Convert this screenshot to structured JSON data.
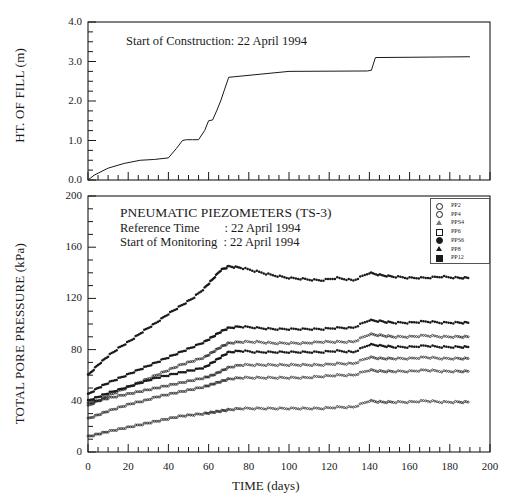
{
  "figure": {
    "width": 518,
    "height": 501,
    "background": "#ffffff",
    "ink": "#1a1a1a"
  },
  "annotations": {
    "construction_note": "Start of Construction: 22 April 1994",
    "pneumatic_title": "PNEUMATIC PIEZOMETERS (TS-3)",
    "reference_time": "Reference Time        : 22 April 1994",
    "start_of_monitoring": "Start of Monitoring  : 22 April 1994"
  },
  "legend": {
    "position": "top-right-inside",
    "entries": [
      {
        "label": "PP2",
        "marker": "open-circle"
      },
      {
        "label": "PP4",
        "marker": "open-circle"
      },
      {
        "label": "PPS4",
        "marker": "open-triangle"
      },
      {
        "label": "PP6",
        "marker": "open-square"
      },
      {
        "label": "PPS6",
        "marker": "filled-circle"
      },
      {
        "label": "PP8",
        "marker": "filled-triangle"
      },
      {
        "label": "PP12",
        "marker": "filled-square"
      }
    ]
  },
  "chart_data": [
    {
      "id": "fill-height",
      "type": "line",
      "title": "",
      "xlabel": "",
      "ylabel": "HT. OF FILL (m)",
      "xlim": [
        0,
        200
      ],
      "ylim": [
        0.0,
        4.0
      ],
      "yticks": [
        0.0,
        1.0,
        2.0,
        3.0,
        4.0
      ],
      "ytick_labels": [
        "0.0",
        "1.0",
        "2.0",
        "3.0",
        "4.0"
      ],
      "yminor_step": 0.25,
      "xticks": [
        0,
        20,
        40,
        60,
        80,
        100,
        120,
        140,
        160,
        180,
        200
      ],
      "grid": false,
      "series": [
        {
          "name": "Height of fill",
          "x": [
            0,
            3,
            10,
            18,
            26,
            33,
            40,
            44,
            47,
            49,
            52,
            55,
            58,
            60,
            62,
            64,
            66,
            68,
            70,
            100,
            139,
            141,
            143,
            190
          ],
          "y": [
            0.0,
            0.12,
            0.3,
            0.42,
            0.5,
            0.52,
            0.56,
            0.8,
            1.0,
            1.02,
            1.02,
            1.02,
            1.25,
            1.5,
            1.52,
            1.75,
            2.0,
            2.3,
            2.6,
            2.75,
            2.76,
            2.78,
            3.1,
            3.12
          ]
        }
      ]
    },
    {
      "id": "total-pore-pressure",
      "type": "scatter",
      "title": "",
      "xlabel": "TIME (days)",
      "ylabel": "TOTAL PORE PRESSURE (kPa)",
      "xlim": [
        0,
        200
      ],
      "ylim": [
        0,
        200
      ],
      "yticks": [
        0,
        40,
        80,
        120,
        160,
        200
      ],
      "ytick_labels": [
        "0",
        "40",
        "80",
        "120",
        "160",
        "200"
      ],
      "yminor_step": 10,
      "xticks": [
        0,
        20,
        40,
        60,
        80,
        100,
        120,
        140,
        160,
        180,
        200
      ],
      "xtick_labels": [
        "0",
        "20",
        "40",
        "60",
        "80",
        "100",
        "120",
        "140",
        "160",
        "180",
        "200"
      ],
      "xminor_step": 5,
      "grid": false,
      "series": [
        {
          "name": "PP2",
          "marker": "filled-small",
          "x": [
            0,
            5,
            10,
            16,
            22,
            28,
            34,
            40,
            46,
            52,
            58,
            62,
            66,
            70,
            76,
            84,
            92,
            100,
            108,
            116,
            124,
            132,
            140,
            146,
            152,
            160,
            168,
            176,
            184,
            190
          ],
          "y": [
            60,
            68,
            75,
            82,
            88,
            95,
            101,
            108,
            114,
            120,
            128,
            135,
            142,
            145,
            144,
            141,
            138,
            136,
            135,
            134,
            136,
            134,
            140,
            138,
            137,
            136,
            136,
            137,
            136,
            136
          ]
        },
        {
          "name": "PP4",
          "marker": "filled-small",
          "x": [
            0,
            5,
            10,
            16,
            22,
            28,
            34,
            40,
            46,
            52,
            58,
            62,
            66,
            70,
            76,
            84,
            92,
            100,
            108,
            116,
            124,
            132,
            140,
            146,
            152,
            160,
            168,
            176,
            184,
            190
          ],
          "y": [
            45,
            50,
            54,
            58,
            62,
            66,
            70,
            74,
            78,
            82,
            86,
            90,
            94,
            97,
            98,
            97,
            96,
            96,
            96,
            96,
            97,
            97,
            103,
            102,
            101,
            101,
            102,
            101,
            101,
            101
          ]
        },
        {
          "name": "PPS4",
          "marker": "open-small",
          "x": [
            0,
            5,
            10,
            16,
            22,
            28,
            34,
            40,
            46,
            52,
            58,
            62,
            66,
            70,
            76,
            84,
            92,
            100,
            108,
            116,
            124,
            132,
            140,
            146,
            152,
            160,
            168,
            176,
            184,
            190
          ],
          "y": [
            36,
            40,
            44,
            48,
            52,
            56,
            60,
            64,
            68,
            71,
            74,
            78,
            82,
            85,
            86,
            86,
            85,
            85,
            85,
            86,
            86,
            86,
            92,
            91,
            90,
            90,
            91,
            90,
            90,
            90
          ]
        },
        {
          "name": "PP6",
          "marker": "filled-small",
          "x": [
            0,
            5,
            10,
            16,
            22,
            28,
            34,
            40,
            46,
            52,
            58,
            62,
            66,
            70,
            76,
            84,
            92,
            100,
            108,
            116,
            124,
            132,
            140,
            146,
            152,
            160,
            168,
            176,
            184,
            190
          ],
          "y": [
            40,
            43,
            46,
            49,
            52,
            55,
            58,
            60,
            62,
            64,
            66,
            70,
            74,
            78,
            79,
            78,
            78,
            78,
            78,
            78,
            79,
            78,
            84,
            83,
            82,
            82,
            83,
            82,
            82,
            82
          ]
        },
        {
          "name": "PPS6",
          "marker": "open-small",
          "x": [
            0,
            5,
            10,
            16,
            22,
            28,
            34,
            40,
            46,
            52,
            58,
            62,
            66,
            70,
            76,
            84,
            92,
            100,
            108,
            116,
            124,
            132,
            140,
            146,
            152,
            160,
            168,
            176,
            184,
            190
          ],
          "y": [
            38,
            40,
            42,
            44,
            46,
            48,
            50,
            52,
            54,
            56,
            58,
            60,
            63,
            66,
            68,
            68,
            68,
            68,
            68,
            68,
            69,
            69,
            74,
            73,
            73,
            73,
            74,
            73,
            73,
            73
          ]
        },
        {
          "name": "PP8",
          "marker": "open-small",
          "x": [
            0,
            5,
            10,
            16,
            22,
            28,
            34,
            40,
            46,
            52,
            58,
            62,
            66,
            70,
            76,
            84,
            92,
            100,
            108,
            116,
            124,
            132,
            140,
            146,
            152,
            160,
            168,
            176,
            184,
            190
          ],
          "y": [
            26,
            29,
            32,
            35,
            38,
            40,
            43,
            45,
            47,
            49,
            51,
            53,
            55,
            57,
            58,
            58,
            58,
            58,
            58,
            59,
            60,
            60,
            64,
            63,
            63,
            63,
            64,
            63,
            63,
            63
          ]
        },
        {
          "name": "PP12",
          "marker": "open-small",
          "x": [
            0,
            5,
            10,
            16,
            22,
            28,
            34,
            40,
            46,
            52,
            58,
            62,
            66,
            70,
            76,
            84,
            92,
            100,
            108,
            116,
            124,
            132,
            140,
            146,
            152,
            160,
            168,
            176,
            184,
            190
          ],
          "y": [
            12,
            14,
            16,
            18,
            20,
            22,
            24,
            26,
            28,
            29,
            30,
            31,
            32,
            33,
            34,
            34,
            34,
            34,
            34,
            34,
            35,
            35,
            40,
            39,
            39,
            39,
            40,
            39,
            39,
            39
          ]
        }
      ]
    }
  ]
}
